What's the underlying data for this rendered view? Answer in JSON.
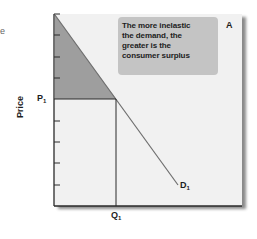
{
  "stray_text": "e",
  "panel": {
    "label": "A"
  },
  "annotation": {
    "lines": [
      "The more inelastic",
      "the demand, the",
      "greater is the",
      "consumer surplus"
    ]
  },
  "axes": {
    "y_label": "Price",
    "price_label": {
      "main": "P",
      "sub": "1"
    },
    "quantity_label": {
      "main": "Q",
      "sub": "1"
    }
  },
  "curve": {
    "label": {
      "main": "D",
      "sub": "1"
    }
  },
  "colors": {
    "plot_background": "#f1f1f1",
    "consumer_surplus_fill": "#9e9e9e",
    "annotation_box": "#c4c4c4",
    "lines": "#333333",
    "demand_line": "#7a7a7a"
  }
}
